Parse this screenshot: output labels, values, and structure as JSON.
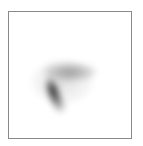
{
  "chart_data": {
    "type": "heatmap",
    "title": "",
    "xlabel": "",
    "ylabel": "",
    "grid": false,
    "legend": null,
    "clusters": [
      {
        "name": "dense-core",
        "center_px": [
          53,
          91
        ],
        "rx": 6,
        "ry": 13,
        "rotation_deg": -20,
        "intensity": 0.95
      },
      {
        "name": "lower-tail",
        "center_px": [
          58,
          103
        ],
        "rx": 6,
        "ry": 10,
        "rotation_deg": -25,
        "intensity": 0.45
      },
      {
        "name": "upper-plume",
        "center_px": [
          70,
          72
        ],
        "rx": 26,
        "ry": 9,
        "rotation_deg": 0,
        "intensity": 0.35
      },
      {
        "name": "halo",
        "center_px": [
          62,
          82
        ],
        "rx": 30,
        "ry": 22,
        "rotation_deg": 0,
        "intensity": 0.12
      }
    ]
  }
}
